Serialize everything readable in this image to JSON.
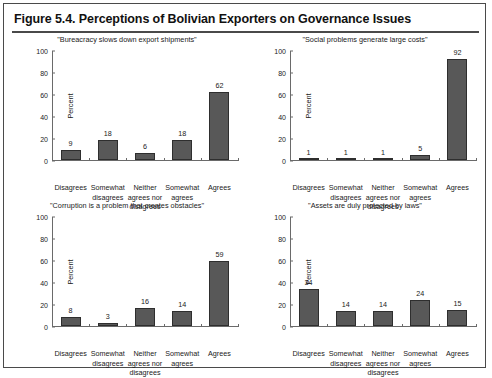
{
  "figure": {
    "title": "Figure 5.4. Perceptions of Bolivian Exporters on Governance Issues"
  },
  "axis": {
    "ylabel": "Percent",
    "yticks": [
      "0",
      "20",
      "40",
      "60",
      "80",
      "100"
    ],
    "categories": [
      "Disagrees",
      "Somewhat disagrees",
      "Neither agrees nor disagrees",
      "Somewhat agrees",
      "Agrees"
    ]
  },
  "colors": {
    "bar_fill": "#585858",
    "bar_edge": "#2e2e2e",
    "axis": "#6a6a6a",
    "frame": "#4a4a4a",
    "text": "#1a1a1a",
    "background": "#ffffff"
  },
  "chart_data": [
    {
      "type": "bar",
      "panel": "top-left",
      "title": "\"Bureacracy slows down export shipments\"",
      "categories": [
        "Disagrees",
        "Somewhat disagrees",
        "Neither agrees nor disagrees",
        "Somewhat agrees",
        "Agrees"
      ],
      "values": [
        9,
        18,
        6,
        18,
        62
      ],
      "xlabel": "",
      "ylabel": "Percent",
      "ylim": [
        0,
        100
      ],
      "yticks": [
        0,
        20,
        40,
        60,
        80,
        100
      ],
      "grid": false,
      "legend": "none"
    },
    {
      "type": "bar",
      "panel": "top-right",
      "title": "\"Social problems generate large costs\"",
      "categories": [
        "Disagrees",
        "Somewhat disagrees",
        "Neither agrees nor disagrees",
        "Somewhat agrees",
        "Agrees"
      ],
      "values": [
        1,
        1,
        1,
        5,
        92
      ],
      "xlabel": "",
      "ylabel": "Percent",
      "ylim": [
        0,
        100
      ],
      "yticks": [
        0,
        20,
        40,
        60,
        80,
        100
      ],
      "grid": false,
      "legend": "none"
    },
    {
      "type": "bar",
      "panel": "bottom-left",
      "title": "\"Corruption is a problem that creates obstacles\"",
      "categories": [
        "Disagrees",
        "Somewhat disagrees",
        "Neither agrees nor disagrees",
        "Somewhat agrees",
        "Agrees"
      ],
      "values": [
        8,
        3,
        16,
        14,
        59
      ],
      "xlabel": "",
      "ylabel": "Percent",
      "ylim": [
        0,
        100
      ],
      "yticks": [
        0,
        20,
        40,
        60,
        80,
        100
      ],
      "grid": false,
      "legend": "none"
    },
    {
      "type": "bar",
      "panel": "bottom-right",
      "title": "\"Assets are duly protected by laws\"",
      "categories": [
        "Disagrees",
        "Somewhat disagrees",
        "Neither agrees nor disagrees",
        "Somewhat agrees",
        "Agrees"
      ],
      "values": [
        34,
        14,
        14,
        24,
        15
      ],
      "xlabel": "",
      "ylabel": "Percent",
      "ylim": [
        0,
        100
      ],
      "yticks": [
        0,
        20,
        40,
        60,
        80,
        100
      ],
      "grid": false,
      "legend": "none"
    }
  ]
}
